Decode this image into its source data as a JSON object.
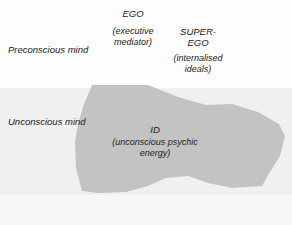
{
  "diagram": {
    "width": 292,
    "height": 225,
    "colors": {
      "preconscious_band": "#fdfdfd",
      "unconscious_band": "#f0f0f0",
      "footer_band": "#f7f7f7",
      "id_shape": "#c3c3c3",
      "text": "#1c1c1c"
    }
  },
  "bands": {
    "preconscious_label": "Preconscious mind",
    "unconscious_label": "Unconscious mind"
  },
  "structures": {
    "ego": {
      "name": "EGO",
      "description": "(executive\nmediator)"
    },
    "superego": {
      "name": "SUPER-\nEGO",
      "description": "(internalised\nideals)"
    },
    "id": {
      "name": "ID",
      "description": "(unconscious psychic\nenergy)"
    }
  },
  "shapes": {
    "id_blob_points": "92,85 148,85 178,97 206,105 232,104 258,112 279,124 285,136 280,156 268,175 262,186 232,188 208,183 188,176 166,178 148,186 126,192 98,193 82,191 76,168 75,142 78,124 84,104"
  }
}
